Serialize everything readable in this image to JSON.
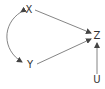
{
  "diagram": {
    "type": "causal-dag",
    "nodes": [
      {
        "id": "X",
        "label": "X",
        "x": 29,
        "y": 10
      },
      {
        "id": "Y",
        "label": "Y",
        "x": 30,
        "y": 65
      },
      {
        "id": "Z",
        "label": "Z",
        "x": 97,
        "y": 36
      },
      {
        "id": "U",
        "label": "U",
        "x": 97,
        "y": 80
      }
    ],
    "edges": [
      {
        "from": "X",
        "to": "Z",
        "type": "directed"
      },
      {
        "from": "Y",
        "to": "Z",
        "type": "directed"
      },
      {
        "from": "U",
        "to": "Z",
        "type": "directed"
      },
      {
        "from": "X",
        "to": "Y",
        "type": "bidirected-curved"
      }
    ],
    "colors": {
      "edge": "#555555",
      "text": "#333333",
      "background": "#ffffff"
    }
  }
}
